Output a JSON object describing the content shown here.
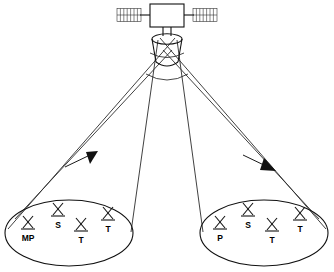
{
  "figure": {
    "background_color": "#ffffff",
    "line_color": "#111111"
  },
  "satellite": {
    "name": "satellite",
    "body_label": "",
    "solar_panel_left": {
      "name": "solar-panel-left",
      "cell_count": 7
    },
    "solar_panel_right": {
      "name": "solar-panel-right",
      "cell_count": 7
    },
    "antenna_horn": {
      "name": "antenna-horn",
      "label": ""
    }
  },
  "beams": [
    {
      "name": "beam-left",
      "direction": "down-left",
      "arrow": "filled-arrowhead"
    },
    {
      "name": "beam-right",
      "direction": "down-right",
      "arrow": "filled-arrowhead"
    }
  ],
  "footprints": [
    {
      "name": "footprint-left",
      "stations": [
        {
          "label": "MP",
          "icon": "antenna-icon",
          "label_position": "below"
        },
        {
          "label": "S",
          "icon": "antenna-icon",
          "label_position": "below"
        },
        {
          "label": "T",
          "icon": "antenna-icon",
          "label_position": "below"
        },
        {
          "label": "T",
          "icon": "antenna-icon",
          "label_position": "below"
        }
      ]
    },
    {
      "name": "footprint-right",
      "stations": [
        {
          "label": "P",
          "icon": "antenna-icon",
          "label_position": "below"
        },
        {
          "label": "S",
          "icon": "antenna-icon",
          "label_position": "below"
        },
        {
          "label": "T",
          "icon": "antenna-icon",
          "label_position": "below"
        },
        {
          "label": "T",
          "icon": "antenna-icon",
          "label_position": "below"
        }
      ]
    }
  ],
  "labels": {
    "l_mp": "MP",
    "l_s1": "S",
    "l_t1": "T",
    "l_t2": "T",
    "r_p": "P",
    "r_s1": "S",
    "r_t1": "T",
    "r_t2": "T"
  }
}
